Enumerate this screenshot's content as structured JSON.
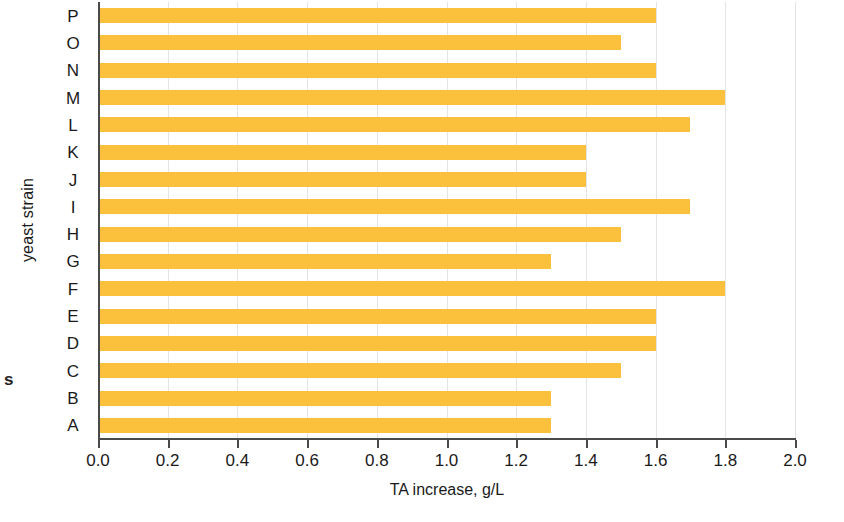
{
  "chart_data": {
    "type": "bar",
    "orientation": "horizontal",
    "title": "",
    "xlabel": "TA increase, g/L",
    "ylabel": "yeast strain",
    "categories": [
      "A",
      "B",
      "C",
      "D",
      "E",
      "F",
      "G",
      "H",
      "I",
      "J",
      "K",
      "L",
      "M",
      "N",
      "O",
      "P"
    ],
    "values": [
      1.3,
      1.3,
      1.5,
      1.6,
      1.6,
      1.8,
      1.3,
      1.5,
      1.7,
      1.4,
      1.4,
      1.7,
      1.8,
      1.6,
      1.5,
      1.6
    ],
    "xlim": [
      0.0,
      2.0
    ],
    "xticks": [
      0.0,
      0.2,
      0.4,
      0.6,
      0.8,
      1.0,
      1.2,
      1.4,
      1.6,
      1.8,
      2.0
    ],
    "xtick_labels": [
      "0.0",
      "0.2",
      "0.4",
      "0.6",
      "0.8",
      "1.0",
      "1.2",
      "1.4",
      "1.6",
      "1.8",
      "2.0"
    ],
    "grid": "vertical-only",
    "legend": "none",
    "bar_color": "#fbc13d",
    "axis_color": "#4a4a4a",
    "gridline_color": "#e4e4e4"
  },
  "artifacts": {
    "stray_margin_character": "s"
  }
}
